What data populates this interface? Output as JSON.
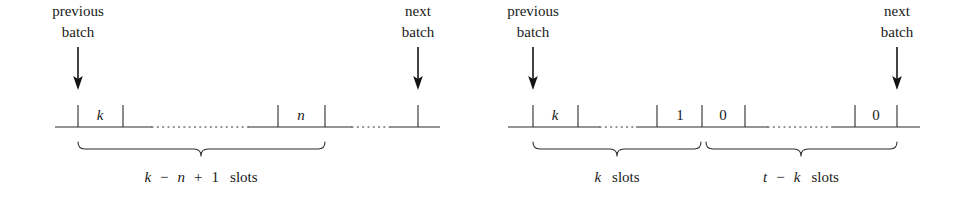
{
  "figure": {
    "type": "timeline-slot-diagram",
    "background_color": "#ffffff",
    "ink_color": "#1a1a1a",
    "panels": [
      {
        "id": "left-panel",
        "name": "left-timeline",
        "annotations": {
          "previous_batch": {
            "line1": "previous",
            "line2": "batch"
          },
          "next_batch": {
            "line1": "next",
            "line2": "batch"
          }
        },
        "slot_labels": [
          {
            "name": "slot-label-k",
            "text": "k",
            "style": "math-italic"
          },
          {
            "name": "slot-label-n",
            "text": "n",
            "style": "math-italic"
          }
        ],
        "brace_label": {
          "name": "brace-label-k-minus-n-plus-1-slots",
          "parts": [
            {
              "text": "k",
              "style": "math-italic"
            },
            {
              "text": "−",
              "style": "operator"
            },
            {
              "text": "n",
              "style": "math-italic"
            },
            {
              "text": "+",
              "style": "operator"
            },
            {
              "text": "1",
              "style": "number"
            },
            {
              "text": "slots",
              "style": "roman"
            }
          ],
          "plain": "k − n + 1 slots"
        }
      },
      {
        "id": "right-panel",
        "name": "right-timeline",
        "annotations": {
          "previous_batch": {
            "line1": "previous",
            "line2": "batch"
          },
          "next_batch": {
            "line1": "next",
            "line2": "batch"
          }
        },
        "slot_labels": [
          {
            "name": "slot-label-k",
            "text": "k",
            "style": "math-italic"
          },
          {
            "name": "slot-label-one",
            "text": "1",
            "style": "number"
          },
          {
            "name": "slot-label-zero-first",
            "text": "0",
            "style": "number"
          },
          {
            "name": "slot-label-zero-last",
            "text": "0",
            "style": "number"
          }
        ],
        "brace_labels": [
          {
            "name": "brace-label-k-slots",
            "parts": [
              {
                "text": "k",
                "style": "math-italic"
              },
              {
                "text": "slots",
                "style": "roman"
              }
            ],
            "plain": "k slots"
          },
          {
            "name": "brace-label-t-minus-k-slots",
            "parts": [
              {
                "text": "t",
                "style": "math-italic"
              },
              {
                "text": "−",
                "style": "operator"
              },
              {
                "text": "k",
                "style": "math-italic"
              },
              {
                "text": "slots",
                "style": "roman"
              }
            ],
            "plain": "t − k slots"
          }
        ]
      }
    ]
  },
  "text": {
    "previous": "previous",
    "batch": "batch",
    "next": "next",
    "slots": "slots",
    "k": "k",
    "n": "n",
    "t": "t",
    "one": "1",
    "zero": "0",
    "minus": "−",
    "plus": "+"
  }
}
